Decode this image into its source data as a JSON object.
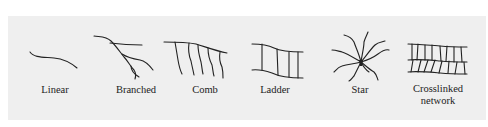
{
  "diagram": {
    "structures": [
      {
        "id": "linear",
        "label": "Linear",
        "icon": "linear-chain-icon"
      },
      {
        "id": "branched",
        "label": "Branched",
        "icon": "branched-chain-icon"
      },
      {
        "id": "comb",
        "label": "Comb",
        "icon": "comb-chain-icon"
      },
      {
        "id": "ladder",
        "label": "Ladder",
        "icon": "ladder-chain-icon"
      },
      {
        "id": "star",
        "label": "Star",
        "icon": "star-chain-icon"
      },
      {
        "id": "crosslinked",
        "label": "Crosslinked",
        "label_line2": "network",
        "icon": "crosslinked-network-icon"
      }
    ]
  }
}
